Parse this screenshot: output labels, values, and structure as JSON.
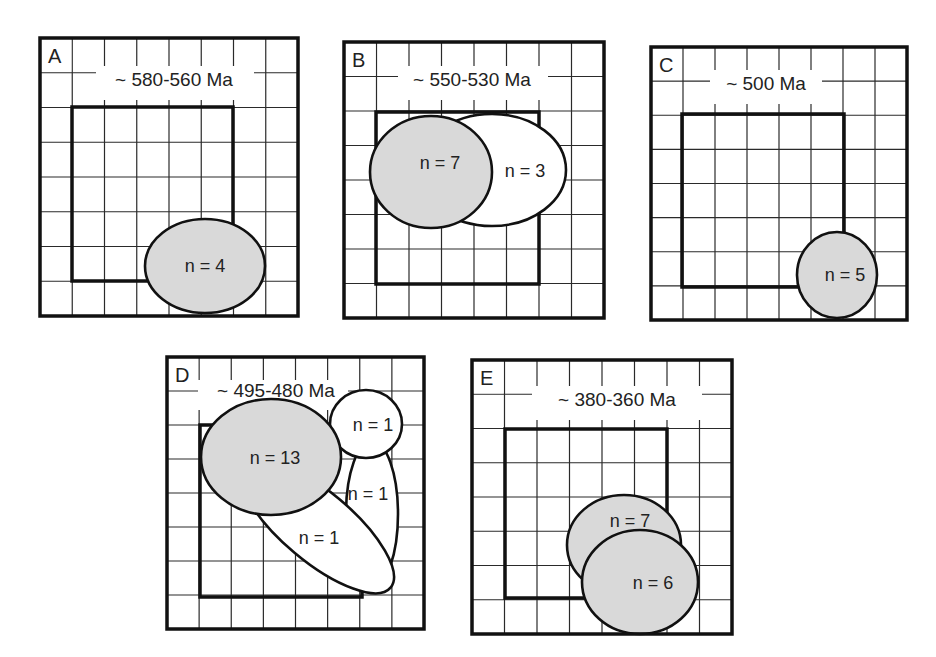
{
  "figure": {
    "width": 936,
    "height": 657,
    "colors": {
      "gray_fill": "#d9d9d9",
      "white_fill": "#ffffff",
      "line": "#111111"
    },
    "panels": [
      {
        "id": "A",
        "letter": "A",
        "title": "~ 580-560 Ma",
        "outer": {
          "x": 40,
          "y": 38,
          "w": 258,
          "h": 278
        },
        "grid": {
          "cols": 8,
          "rows": 8
        },
        "inner": {
          "x": 72,
          "y": 107,
          "w": 161,
          "h": 174
        },
        "title_pos": {
          "x": 174,
          "y": 86
        },
        "title_bg": {
          "x": 96,
          "y": 66,
          "w": 158,
          "h": 34
        },
        "ellipses": [
          {
            "cx": 205,
            "cy": 266,
            "rx": 60,
            "ry": 47,
            "rot": 0,
            "fill": "gray",
            "label": "n = 4",
            "lx": 205,
            "ly": 272
          }
        ]
      },
      {
        "id": "B",
        "letter": "B",
        "title": "~ 550-530 Ma",
        "outer": {
          "x": 344,
          "y": 42,
          "w": 260,
          "h": 276
        },
        "grid": {
          "cols": 8,
          "rows": 8
        },
        "inner": {
          "x": 376,
          "y": 112,
          "w": 163,
          "h": 172
        },
        "title_pos": {
          "x": 472,
          "y": 86
        },
        "title_bg": {
          "x": 398,
          "y": 66,
          "w": 150,
          "h": 34
        },
        "ellipses": [
          {
            "cx": 492,
            "cy": 170,
            "rx": 74,
            "ry": 56,
            "rot": 0,
            "fill": "white",
            "label": "n = 3",
            "lx": 525,
            "ly": 177
          },
          {
            "cx": 431,
            "cy": 172,
            "rx": 61,
            "ry": 56,
            "rot": 0,
            "fill": "gray",
            "label": "n = 7",
            "lx": 440,
            "ly": 169
          }
        ]
      },
      {
        "id": "C",
        "letter": "C",
        "title": "~ 500 Ma",
        "outer": {
          "x": 651,
          "y": 47,
          "w": 256,
          "h": 273
        },
        "grid": {
          "cols": 8,
          "rows": 8
        },
        "inner": {
          "x": 682,
          "y": 114,
          "w": 162,
          "h": 173
        },
        "title_pos": {
          "x": 766,
          "y": 90
        },
        "title_bg": {
          "x": 710,
          "y": 70,
          "w": 112,
          "h": 34
        },
        "ellipses": [
          {
            "cx": 837,
            "cy": 275,
            "rx": 40,
            "ry": 43,
            "rot": 0,
            "fill": "gray",
            "label": "n = 5",
            "lx": 845,
            "ly": 281
          }
        ]
      },
      {
        "id": "D",
        "letter": "D",
        "title": "~ 495-480 Ma",
        "outer": {
          "x": 167,
          "y": 357,
          "w": 257,
          "h": 272
        },
        "grid": {
          "cols": 8,
          "rows": 8
        },
        "inner": {
          "x": 200,
          "y": 425,
          "w": 162,
          "h": 172
        },
        "title_pos": {
          "x": 276,
          "y": 397
        },
        "title_bg": {
          "x": 198,
          "y": 380,
          "w": 150,
          "h": 30
        },
        "ellipses": [
          {
            "cx": 372,
            "cy": 514,
            "rx": 26,
            "ry": 73,
            "rot": 0,
            "fill": "white",
            "label": "n = 1",
            "lx": 368,
            "ly": 500
          },
          {
            "cx": 317,
            "cy": 526,
            "rx": 96,
            "ry": 35,
            "rot": 40,
            "fill": "white",
            "label": "n = 1",
            "lx": 319,
            "ly": 544
          },
          {
            "cx": 366,
            "cy": 424,
            "rx": 36,
            "ry": 34,
            "rot": 0,
            "fill": "white",
            "label": "n = 1",
            "lx": 373,
            "ly": 431
          },
          {
            "cx": 271,
            "cy": 457,
            "rx": 70,
            "ry": 58,
            "rot": 0,
            "fill": "gray",
            "label": "n = 13",
            "lx": 275,
            "ly": 464
          }
        ]
      },
      {
        "id": "E",
        "letter": "E",
        "title": "~ 380-360 Ma",
        "outer": {
          "x": 472,
          "y": 360,
          "w": 260,
          "h": 274
        },
        "grid": {
          "cols": 8,
          "rows": 8
        },
        "inner": {
          "x": 505,
          "y": 429,
          "w": 162,
          "h": 169
        },
        "title_pos": {
          "x": 617,
          "y": 406
        },
        "title_bg": {
          "x": 532,
          "y": 386,
          "w": 170,
          "h": 34
        },
        "ellipses": [
          {
            "cx": 624,
            "cy": 545,
            "rx": 57,
            "ry": 50,
            "rot": 0,
            "fill": "gray",
            "label": "n = 7",
            "lx": 630,
            "ly": 527
          },
          {
            "cx": 640,
            "cy": 582,
            "rx": 58,
            "ry": 52,
            "rot": 0,
            "fill": "gray",
            "label": "n = 6",
            "lx": 653,
            "ly": 589
          }
        ]
      }
    ]
  }
}
